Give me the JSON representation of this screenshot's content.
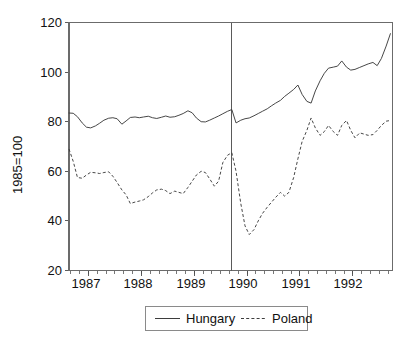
{
  "chart_data": {
    "type": "line",
    "title": "",
    "subtitle": "",
    "xlabel": "",
    "ylabel": "1985=100",
    "ylim": [
      20,
      120
    ],
    "yticks": [
      20,
      40,
      60,
      80,
      100,
      120
    ],
    "ytick_labels": [
      "20",
      "40",
      "60",
      "80",
      "100",
      "120"
    ],
    "xlim": [
      1986.63,
      1992.75
    ],
    "xticks": [
      1987,
      1988,
      1989,
      1990,
      1991,
      1992
    ],
    "xtick_labels": [
      "1987",
      "1988",
      "1989",
      "1990",
      "1991",
      "1992"
    ],
    "x_minor_tick_interval_months": 2,
    "grid": false,
    "legend_position": "bottom-center",
    "annotations": [
      {
        "type": "vertical-line",
        "x": 1989.71,
        "label": ""
      }
    ],
    "x": [
      1986.63,
      1986.71,
      1986.79,
      1986.88,
      1986.96,
      1987.04,
      1987.13,
      1987.21,
      1987.29,
      1987.38,
      1987.46,
      1987.54,
      1987.63,
      1987.71,
      1987.79,
      1987.88,
      1987.96,
      1988.04,
      1988.13,
      1988.21,
      1988.29,
      1988.38,
      1988.46,
      1988.54,
      1988.63,
      1988.71,
      1988.79,
      1988.88,
      1988.96,
      1989.04,
      1989.13,
      1989.21,
      1989.29,
      1989.38,
      1989.46,
      1989.54,
      1989.63,
      1989.71,
      1989.79,
      1989.88,
      1989.96,
      1990.04,
      1990.13,
      1990.21,
      1990.29,
      1990.38,
      1990.46,
      1990.54,
      1990.63,
      1990.71,
      1990.79,
      1990.88,
      1990.96,
      1991.04,
      1991.13,
      1991.21,
      1991.29,
      1991.38,
      1991.46,
      1991.54,
      1991.63,
      1991.71,
      1991.79,
      1991.88,
      1991.96,
      1992.04,
      1992.13,
      1992.21,
      1992.29,
      1992.38,
      1992.46,
      1992.54,
      1992.63,
      1992.71
    ],
    "series": [
      {
        "name": "Hungary",
        "style": "solid",
        "values": [
          83.5,
          83.4,
          82.0,
          79.5,
          77.8,
          77.5,
          78.3,
          79.4,
          80.6,
          81.4,
          81.6,
          81.2,
          79.0,
          80.3,
          81.7,
          81.9,
          81.6,
          81.9,
          82.2,
          81.6,
          81.3,
          81.8,
          82.3,
          81.8,
          82.0,
          82.6,
          83.3,
          84.4,
          83.6,
          81.5,
          80.0,
          79.9,
          80.6,
          81.5,
          82.3,
          83.2,
          84.2,
          84.9,
          79.5,
          80.6,
          81.2,
          81.5,
          82.4,
          83.3,
          84.2,
          85.2,
          86.4,
          87.5,
          88.6,
          90.2,
          91.5,
          93.0,
          94.8,
          91.0,
          88.2,
          87.5,
          92.4,
          96.5,
          99.5,
          101.6,
          102.0,
          102.4,
          104.5,
          102.0,
          100.8,
          101.1,
          101.9,
          102.6,
          103.3,
          103.9,
          102.6,
          105.5,
          110.5,
          115.5
        ]
      },
      {
        "name": "Poland",
        "style": "dashed",
        "values": [
          69.0,
          64.0,
          57.5,
          57.2,
          58.5,
          59.6,
          59.4,
          59.1,
          59.5,
          59.8,
          58.0,
          55.5,
          52.5,
          50.5,
          47.0,
          47.6,
          48.0,
          48.5,
          49.8,
          51.3,
          52.5,
          52.8,
          52.2,
          51.0,
          52.0,
          51.5,
          51.0,
          53.5,
          56.0,
          58.5,
          60.0,
          59.5,
          57.0,
          54.0,
          56.0,
          63.5,
          66.5,
          67.5,
          60.0,
          47.0,
          38.0,
          34.5,
          36.5,
          40.0,
          43.0,
          45.5,
          47.5,
          49.5,
          51.5,
          50.0,
          51.5,
          57.5,
          65.0,
          72.0,
          76.5,
          81.5,
          77.5,
          74.5,
          76.0,
          78.5,
          76.0,
          74.5,
          78.5,
          80.5,
          76.5,
          73.5,
          75.5,
          75.0,
          74.5,
          74.8,
          76.5,
          78.5,
          80.2,
          80.5
        ]
      }
    ]
  },
  "legend": {
    "entries": [
      {
        "label": "Hungary",
        "style": "solid"
      },
      {
        "label": "Poland",
        "style": "dashed"
      }
    ]
  }
}
